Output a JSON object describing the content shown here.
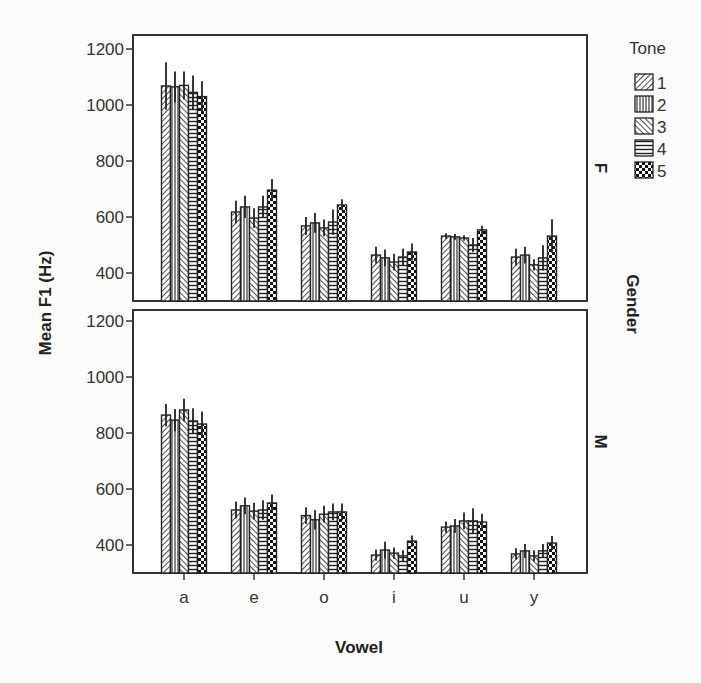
{
  "chart_data": {
    "type": "bar",
    "title": "",
    "xlabel": "Vowel",
    "ylabel": "Mean F1 (Hz)",
    "facet_label": "Gender",
    "legend_title": "Tone",
    "legend_position": "right",
    "grid": false,
    "ylim": [
      300,
      1260
    ],
    "yticks": [
      400,
      600,
      800,
      1000,
      1200
    ],
    "categories": [
      "a",
      "e",
      "o",
      "i",
      "u",
      "y"
    ],
    "legend": [
      {
        "label": "1",
        "pattern": "diagonal-down"
      },
      {
        "label": "2",
        "pattern": "vertical"
      },
      {
        "label": "3",
        "pattern": "diagonal-up"
      },
      {
        "label": "4",
        "pattern": "horizontal"
      },
      {
        "label": "5",
        "pattern": "checker"
      }
    ],
    "panels": [
      {
        "label": "F",
        "series": [
          {
            "name": "1",
            "values": [
              1068,
              618,
              568,
              464,
              532,
              457
            ],
            "error": [
              85,
              40,
              32,
              30,
              10,
              30
            ]
          },
          {
            "name": "2",
            "values": [
              1065,
              636,
              579,
              454,
              529,
              464
            ],
            "error": [
              55,
              40,
              35,
              30,
              10,
              30
            ]
          },
          {
            "name": "3",
            "values": [
              1070,
              596,
              561,
              439,
              525,
              429
            ],
            "error": [
              50,
              35,
              30,
              30,
              10,
              20
            ]
          },
          {
            "name": "4",
            "values": [
              1045,
              636,
              582,
              457,
              500,
              454
            ],
            "error": [
              60,
              40,
              45,
              30,
              25,
              45
            ]
          },
          {
            "name": "5",
            "values": [
              1030,
              696,
              643,
              475,
              554,
              532
            ],
            "error": [
              55,
              40,
              20,
              30,
              15,
              60
            ]
          }
        ]
      },
      {
        "label": "M",
        "series": [
          {
            "name": "1",
            "values": [
              864,
              525,
              505,
              364,
              464,
              368
            ],
            "error": [
              40,
              30,
              30,
              20,
              20,
              20
            ]
          },
          {
            "name": "2",
            "values": [
              846,
              540,
              490,
              382,
              468,
              379
            ],
            "error": [
              40,
              30,
              35,
              30,
              25,
              25
            ]
          },
          {
            "name": "3",
            "values": [
              882,
              521,
              510,
              371,
              486,
              361
            ],
            "error": [
              40,
              30,
              30,
              20,
              30,
              20
            ]
          },
          {
            "name": "4",
            "values": [
              843,
              525,
              518,
              361,
              486,
              379
            ],
            "error": [
              45,
              35,
              30,
              20,
              45,
              25
            ]
          },
          {
            "name": "5",
            "values": [
              832,
              550,
              518,
              414,
              482,
              407
            ],
            "error": [
              45,
              30,
              30,
              20,
              30,
              25
            ]
          }
        ]
      }
    ]
  }
}
